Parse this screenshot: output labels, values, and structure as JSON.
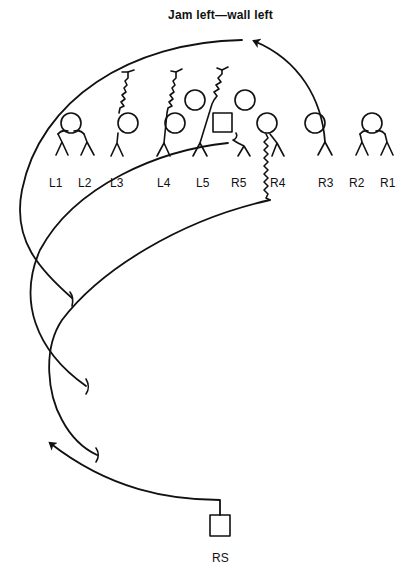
{
  "diagram": {
    "title": "Jam left—wall left",
    "colors": {
      "ink": "#111111",
      "background": "#ffffff"
    },
    "players": [
      {
        "id": "L1",
        "label": "L1",
        "x": 57
      },
      {
        "id": "L2",
        "label": "L2",
        "x": 85
      },
      {
        "id": "L3",
        "label": "L3",
        "x": 117
      },
      {
        "id": "L4",
        "label": "L4",
        "x": 163
      },
      {
        "id": "L5",
        "label": "L5",
        "x": 201
      },
      {
        "id": "R5",
        "label": "R5",
        "x": 238
      },
      {
        "id": "R4",
        "label": "R4",
        "x": 277
      },
      {
        "id": "R3",
        "label": "R3",
        "x": 325
      },
      {
        "id": "R2",
        "label": "R2",
        "x": 357
      },
      {
        "id": "R1",
        "label": "R1",
        "x": 387
      }
    ],
    "returner": {
      "label": "RS"
    },
    "legend_symbols": {
      "circle": "player",
      "square": "kicker / returner",
      "zigzag": "jam / pursuit path",
      "t-bar": "block",
      "arrow": "route"
    }
  }
}
